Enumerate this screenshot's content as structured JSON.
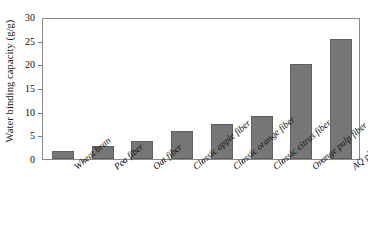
{
  "chart_data": {
    "type": "bar",
    "title": "",
    "xlabel": "",
    "ylabel": "Water binding capacity (g/g)",
    "ylim": [
      0,
      30
    ],
    "yticks": [
      0,
      5,
      10,
      15,
      20,
      25,
      30
    ],
    "ytick_labels": [
      "0",
      "5",
      "10",
      "15",
      "20",
      "25",
      "30"
    ],
    "grid": false,
    "legend": "none",
    "bar_color": "#767676",
    "bar_edge_color": "#5f5f5f",
    "axis_color": "#8a8a8a",
    "categories": [
      "Wheat bran",
      "Pea fiber",
      "Oat fiber",
      "Classic apple fiber",
      "Classic orange fiber",
      "Classic citrus fiber",
      "Orange pulp fiber",
      "AQ plus citrus"
    ],
    "values": [
      1.7,
      2.8,
      3.9,
      5.9,
      7.3,
      9.1,
      20.0,
      25.3
    ]
  }
}
